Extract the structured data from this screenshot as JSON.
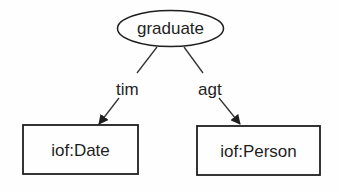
{
  "diagram": {
    "root": {
      "label": "graduate",
      "shape": "ellipse"
    },
    "edges": [
      {
        "label": "tim",
        "target": "iof:Date"
      },
      {
        "label": "agt",
        "target": "iof:Person"
      }
    ],
    "nodes": [
      {
        "label": "iof:Date",
        "shape": "rectangle"
      },
      {
        "label": "iof:Person",
        "shape": "rectangle"
      }
    ],
    "colors": {
      "stroke": "#1e1e1e",
      "background": "#fefefe"
    }
  }
}
